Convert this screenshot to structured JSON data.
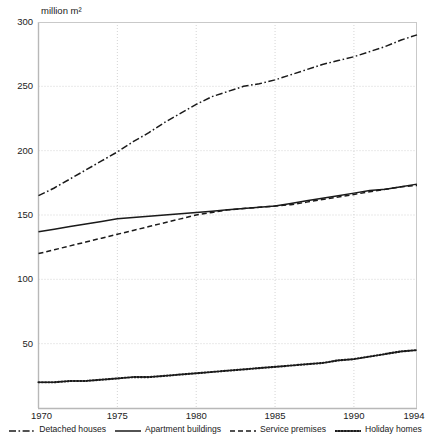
{
  "chart_data": {
    "type": "line",
    "title": "",
    "subtitle": "",
    "ylabel": "million m²",
    "xlabel": "",
    "ylim": [
      0,
      300
    ],
    "xlim": [
      1970,
      1994
    ],
    "yticks": [
      300,
      250,
      200,
      150,
      100,
      50
    ],
    "xticks": [
      1970,
      1975,
      1980,
      1985,
      1990,
      1994
    ],
    "grid": true,
    "legend_position": "bottom",
    "x": [
      1970,
      1971,
      1972,
      1973,
      1974,
      1975,
      1976,
      1977,
      1978,
      1979,
      1980,
      1981,
      1982,
      1983,
      1984,
      1985,
      1986,
      1987,
      1988,
      1989,
      1990,
      1991,
      1992,
      1993,
      1994
    ],
    "series": [
      {
        "name": "Detached houses",
        "style": "dashdot",
        "color": "#1a1a1a",
        "values": [
          165,
          171,
          178,
          185,
          192,
          199,
          207,
          214,
          222,
          229,
          236,
          242,
          246,
          250,
          252,
          255,
          259,
          263,
          267,
          270,
          273,
          277,
          281,
          286,
          290
        ]
      },
      {
        "name": "Apartment buildings",
        "style": "solid",
        "color": "#1a1a1a",
        "values": [
          137,
          139,
          141,
          143,
          145,
          147,
          148,
          149,
          150,
          151,
          152,
          153,
          154,
          155,
          156,
          157,
          159,
          161,
          163,
          165,
          167,
          169,
          170,
          172,
          174
        ]
      },
      {
        "name": "Service premises",
        "style": "dashed",
        "color": "#1a1a1a",
        "values": [
          120,
          123,
          126,
          129,
          132,
          135,
          138,
          141,
          144,
          147,
          150,
          152,
          154,
          155,
          156,
          157,
          158,
          160,
          162,
          164,
          166,
          168,
          170,
          172,
          173
        ]
      },
      {
        "name": "Holiday homes",
        "style": "dotted",
        "color": "#1a1a1a",
        "values": [
          20,
          20,
          21,
          21,
          22,
          23,
          24,
          24,
          25,
          26,
          27,
          28,
          29,
          30,
          31,
          32,
          33,
          34,
          35,
          37,
          38,
          40,
          42,
          44,
          45
        ]
      }
    ]
  },
  "axis": {
    "unit_label": "million m²",
    "y_tick_labels": [
      "300",
      "250",
      "200",
      "150",
      "100",
      "50"
    ],
    "x_tick_labels": [
      "1970",
      "1975",
      "1980",
      "1985",
      "1990",
      "1994"
    ]
  },
  "legend": {
    "items": [
      {
        "label": "Detached houses",
        "style": "dashdot"
      },
      {
        "label": "Apartment buildings",
        "style": "solid"
      },
      {
        "label": "Service premises",
        "style": "dashed"
      },
      {
        "label": "Holiday homes",
        "style": "dotted"
      }
    ]
  }
}
